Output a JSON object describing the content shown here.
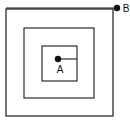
{
  "figure": {
    "background_color": "#ffffff",
    "stroke_color": "#1a1a1a",
    "point_color": "#111111",
    "width": 130,
    "height": 122
  },
  "squares": [
    {
      "name": "outer-square",
      "x": 6,
      "y": 9,
      "size": 107,
      "stroke_width": 1.2
    },
    {
      "name": "middle-square",
      "x": 24,
      "y": 28,
      "size": 70,
      "stroke_width": 1.1
    },
    {
      "name": "inner-square",
      "x": 42,
      "y": 46,
      "size": 35,
      "stroke_width": 1.1
    }
  ],
  "points": [
    {
      "id": "A",
      "label": "A",
      "cx": 58,
      "cy": 59,
      "r": 3.2,
      "label_x": 60,
      "label_y": 73,
      "leader": {
        "x1": 58,
        "y1": 59,
        "x2": 77,
        "y2": 59
      }
    },
    {
      "id": "B",
      "label": "B",
      "cx": 117,
      "cy": 8,
      "r": 3.2,
      "label_x": 126,
      "label_y": 12,
      "leader": {
        "x1": 6,
        "y1": 8,
        "x2": 117,
        "y2": 8
      }
    }
  ]
}
